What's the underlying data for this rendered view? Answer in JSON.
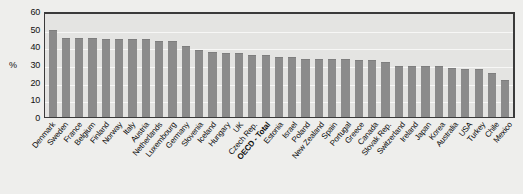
{
  "chart_data": {
    "type": "bar",
    "title": "",
    "subtitle": "",
    "xlabel": "",
    "ylabel": "%",
    "ylim": [
      0,
      60
    ],
    "yticks": [
      0,
      10,
      20,
      30,
      40,
      50,
      60
    ],
    "grid": true,
    "legend": "none",
    "bar_color": "#8b8b8b",
    "highlight_category": "OECD - Total",
    "categories": [
      "Denmark",
      "Sweden",
      "France",
      "Belgium",
      "Finland",
      "Norway",
      "Italy",
      "Austria",
      "Netherlands",
      "Luxembourg",
      "Germany",
      "Slovenia",
      "Iceland",
      "Hungary",
      "UK",
      "Czech Rep.",
      "OECD - Total",
      "Estonia",
      "Israel",
      "Poland",
      "New Zealand",
      "Spain",
      "Portugal",
      "Greece",
      "Canada",
      "Slovak Rep.",
      "Switzerland",
      "Ireland",
      "Japan",
      "Korea",
      "Australia",
      "USA",
      "Turkey",
      "Chile",
      "Mexico"
    ],
    "values": [
      49,
      45,
      45,
      45,
      44,
      44,
      44,
      44,
      43,
      43,
      40,
      38,
      37,
      36,
      36,
      35,
      35,
      34,
      34,
      33,
      33,
      33,
      33,
      32,
      32,
      31,
      29,
      29,
      29,
      29,
      28,
      27,
      27,
      25,
      21
    ]
  },
  "axis": {
    "y_unit_label": "%"
  }
}
